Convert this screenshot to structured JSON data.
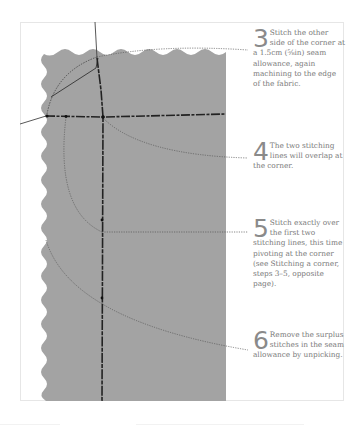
{
  "illustration": {
    "subject": "stitching-a-corner-fabric",
    "colors": {
      "fabric": "#a3a3a3",
      "stitch": "#2a2a2a",
      "leader": "#555555",
      "frame_border": "#e6e6e6",
      "text": "#7a7a7a"
    }
  },
  "steps": [
    {
      "number": "3",
      "text": "Stitch the other side of the corner at a 1.5cm (⅝in) seam allowance, again machining to the edge of the fabric."
    },
    {
      "number": "4",
      "text": "The two stitching lines will overlap at the corner."
    },
    {
      "number": "5",
      "text": "Stitch exactly over the first two stitching lines, this time pivoting at the corner (see Stitching a corner, steps 3–5, opposite page)."
    },
    {
      "number": "6",
      "text": "Remove the surplus stitches in the seam allowance by unpicking."
    }
  ]
}
